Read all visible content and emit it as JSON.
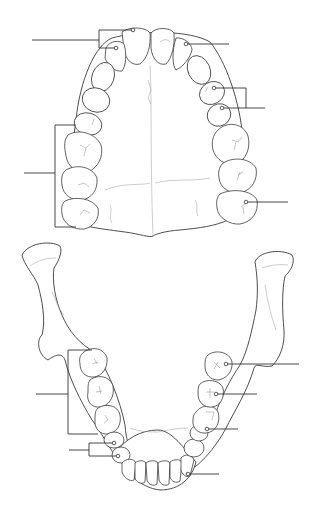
{
  "diagram": {
    "title": "",
    "colors": {
      "background": "#ffffff",
      "line": "#3a3a3a",
      "leader": "#333333"
    },
    "labels": {
      "upper_incisors_bracket": "",
      "upper_right_incisor": "",
      "upper_premolars_bracket": "",
      "upper_molars_bracket": "",
      "upper_third_molar": "",
      "lower_molars_bracket": "",
      "lower_premolars_bracket": "",
      "lower_first_molar": "",
      "lower_second_molar": "",
      "lower_third_molar_point": "",
      "lower_canine": ""
    }
  }
}
